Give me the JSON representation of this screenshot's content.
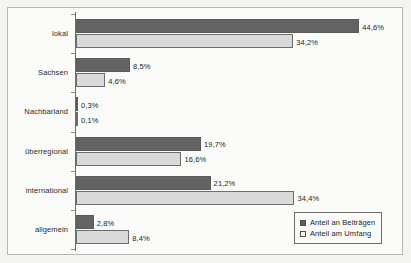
{
  "chart_data": {
    "type": "bar",
    "orientation": "horizontal",
    "title": "",
    "xlabel": "",
    "ylabel": "",
    "grid": false,
    "legend_position": "bottom-right",
    "xlim": [
      0,
      50
    ],
    "value_suffix": "%",
    "decimal_separator": ",",
    "categories": [
      "lokal",
      "Sachsen",
      "Nachbarland",
      "überregional",
      "international",
      "allgemein"
    ],
    "series": [
      {
        "name": "Anteil an Beiträgen",
        "color": "#636363",
        "values": [
          44.6,
          8.5,
          0.3,
          19.7,
          21.2,
          2.8
        ],
        "labels": [
          "44,6%",
          "8,5%",
          "0,3%",
          "19,7%",
          "21,2%",
          "2,8%"
        ]
      },
      {
        "name": "Anteil am Umfang",
        "color": "#d9d9d9",
        "values": [
          34.2,
          4.6,
          0.1,
          16.6,
          34.4,
          8.4
        ],
        "labels": [
          "34,2%",
          "4,6%",
          "0,1%",
          "16,6%",
          "34,4%",
          "8,4%"
        ]
      }
    ]
  },
  "legend": {
    "entries": [
      {
        "label": "Anteil an Beiträgen",
        "swatch": "dark-square-icon"
      },
      {
        "label": "Anteil am Umfang",
        "swatch": "light-square-icon"
      }
    ]
  }
}
